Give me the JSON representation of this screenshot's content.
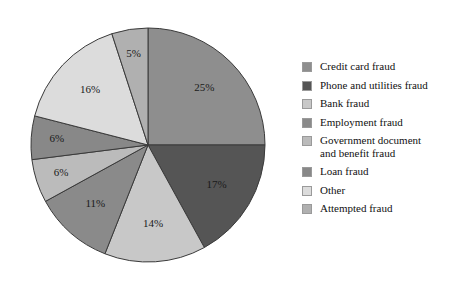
{
  "chart_data": {
    "type": "pie",
    "title": "",
    "legend_position": "right",
    "labels": [
      "Credit card fraud",
      "Phone and utilities fraud",
      "Bank fraud",
      "Employment fraud",
      "Government document\nand benefit fraud",
      "Loan fraud",
      "Other",
      "Attempted fraud"
    ],
    "values": [
      25,
      17,
      14,
      11,
      6,
      6,
      16,
      5
    ],
    "value_labels": [
      "25%",
      "17%",
      "14%",
      "11%",
      "6%",
      "6%",
      "16%",
      "5%"
    ],
    "colors": [
      "#8e8e8e",
      "#555555",
      "#c8c8c8",
      "#8a8a8a",
      "#bbbbbb",
      "#888888",
      "#dcdcdc",
      "#b0b0b0"
    ],
    "slice_order": "clockwise from 12 o'clock",
    "slices": [
      {
        "label": "Credit card fraud",
        "value": 25,
        "value_label": "25%",
        "color": "#8e8e8e"
      },
      {
        "label": "Phone and utilities fraud",
        "value": 17,
        "value_label": "17%",
        "color": "#555555"
      },
      {
        "label": "Bank fraud",
        "value": 14,
        "value_label": "14%",
        "color": "#c8c8c8"
      },
      {
        "label": "Employment fraud",
        "value": 11,
        "value_label": "11%",
        "color": "#8a8a8a"
      },
      {
        "label": "Government document and benefit fraud",
        "value": 6,
        "value_label": "6%",
        "color": "#bbbbbb"
      },
      {
        "label": "Loan fraud",
        "value": 6,
        "value_label": "6%",
        "color": "#888888"
      },
      {
        "label": "Other",
        "value": 16,
        "value_label": "16%",
        "color": "#dcdcdc"
      },
      {
        "label": "Attempted fraud",
        "value": 5,
        "value_label": "5%",
        "color": "#b0b0b0"
      }
    ]
  },
  "legend": {
    "items": [
      {
        "label": "Credit card fraud",
        "color": "#8e8e8e"
      },
      {
        "label": "Phone and utilities fraud",
        "color": "#555555"
      },
      {
        "label": "Bank fraud",
        "color": "#c8c8c8"
      },
      {
        "label": "Employment fraud",
        "color": "#8a8a8a"
      },
      {
        "label": "Government document\nand benefit fraud",
        "color": "#bbbbbb"
      },
      {
        "label": "Loan fraud",
        "color": "#888888"
      },
      {
        "label": "Other",
        "color": "#dcdcdc"
      },
      {
        "label": "Attempted fraud",
        "color": "#b0b0b0"
      }
    ]
  },
  "style": {
    "slice_stroke": "#3a3a3a",
    "background": "#ffffff",
    "label_color": "#1a1a1a"
  }
}
